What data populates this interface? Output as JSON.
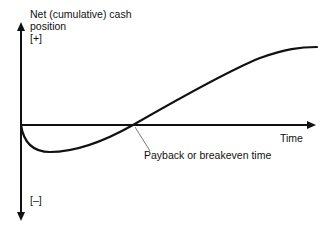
{
  "diagram": {
    "y_axis": {
      "label_line1": "Net (cumulative) cash",
      "label_line2": "position",
      "positive_marker": "[+]",
      "negative_marker": "[–]"
    },
    "x_axis": {
      "label": "Time"
    },
    "annotation": {
      "label": "Payback or breakeven time"
    },
    "curve": {
      "description": "Cumulative cash position starts at zero, dips negative, crosses zero at payback point, then rises positive and levels off"
    },
    "colors": {
      "line": "#111111",
      "background": "#ffffff",
      "leader_line": "#555555"
    }
  }
}
